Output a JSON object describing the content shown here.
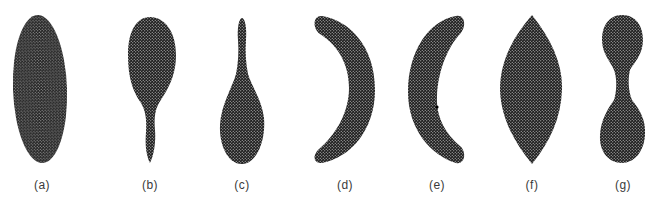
{
  "figure": {
    "fill_color": "#2b2b2b",
    "background": "#ffffff",
    "shapes": [
      {
        "id": "a",
        "label": "(a)",
        "shape": "elongated-ellipse",
        "label_x": 42
      },
      {
        "id": "b",
        "label": "(b)",
        "shape": "spoon-bulb-top-stem-bottom",
        "label_x": 150
      },
      {
        "id": "c",
        "label": "(c)",
        "shape": "teardrop-stem-top-bulb-bottom",
        "label_x": 242
      },
      {
        "id": "d",
        "label": "(d)",
        "shape": "crescent-opening-left",
        "label_x": 345
      },
      {
        "id": "e",
        "label": "(e)",
        "shape": "crescent-opening-right-with-dot",
        "label_x": 437
      },
      {
        "id": "f",
        "label": "(f)",
        "shape": "lens-pointed-ends",
        "label_x": 532
      },
      {
        "id": "g",
        "label": "(g)",
        "shape": "dumbbell",
        "label_x": 623
      }
    ]
  }
}
